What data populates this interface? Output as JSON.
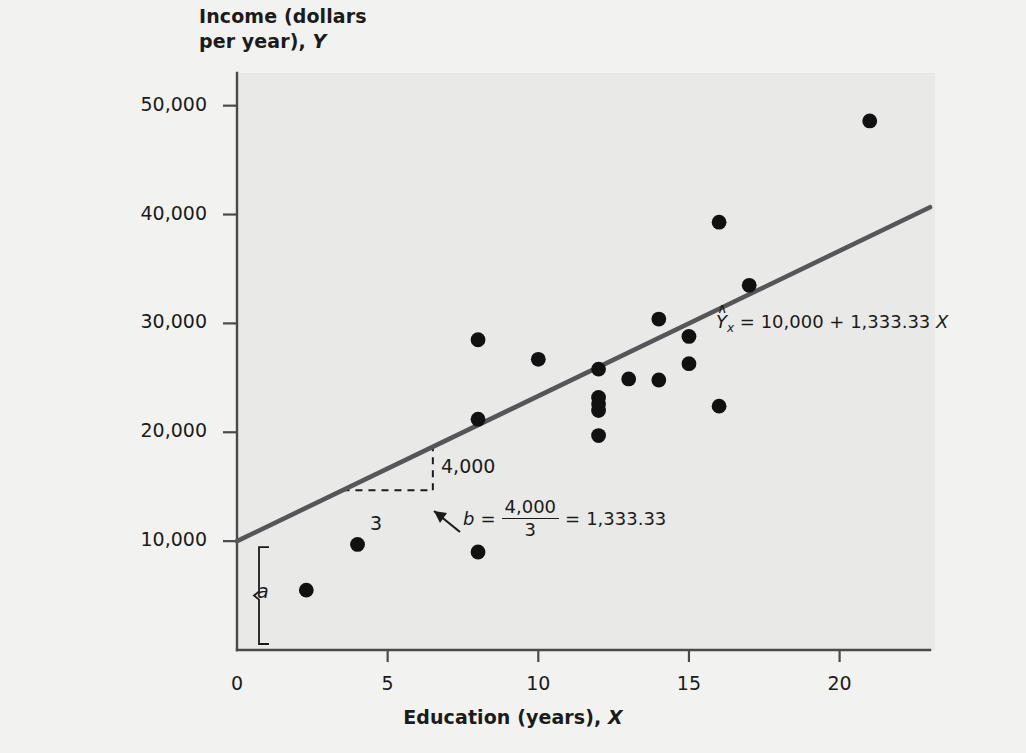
{
  "axes": {
    "y_title_line1": "Income (dollars",
    "y_title_line2": "per year), ",
    "y_title_var": "Y",
    "x_title": "Education (years), ",
    "x_title_var": "X",
    "y_ticks": [
      "50,000",
      "40,000",
      "30,000",
      "20,000",
      "10,000"
    ],
    "x_ticks": [
      "0",
      "5",
      "10",
      "15",
      "20"
    ]
  },
  "annotations": {
    "equation_var": "Y",
    "equation_hat": "∧",
    "equation_sub": "x",
    "equation_rest": " = 10,000 + 1,333.33 ",
    "equation_xvar": "X",
    "rise_label": "4,000",
    "run_label": "3",
    "intercept_label": "a",
    "slope_symbol": "b",
    "slope_equals": "=",
    "slope_numerator": "4,000",
    "slope_denominator": "3",
    "slope_equals2": "=",
    "slope_value": "1,333.33"
  },
  "colors": {
    "page_background": "#f2f2f0",
    "plot_background": "#e9e9e7",
    "axis": "#4a4a4a",
    "regression_line": "#55555a",
    "point": "#111111",
    "text": "#1b1b1b"
  },
  "chart_data": {
    "type": "scatter",
    "title": "",
    "xlabel": "Education (years), X",
    "ylabel": "Income (dollars per year), Y",
    "xlim": [
      0,
      23
    ],
    "ylim": [
      0,
      53000
    ],
    "grid": false,
    "legend": null,
    "points": [
      {
        "x": 2.3,
        "y": 5500
      },
      {
        "x": 4.0,
        "y": 9700
      },
      {
        "x": 8.0,
        "y": 9000
      },
      {
        "x": 8.0,
        "y": 21200
      },
      {
        "x": 8.0,
        "y": 28500
      },
      {
        "x": 10.0,
        "y": 26700
      },
      {
        "x": 12.0,
        "y": 19700
      },
      {
        "x": 12.0,
        "y": 22000
      },
      {
        "x": 12.0,
        "y": 22600
      },
      {
        "x": 12.0,
        "y": 23200
      },
      {
        "x": 12.0,
        "y": 25800
      },
      {
        "x": 13.0,
        "y": 24900
      },
      {
        "x": 14.0,
        "y": 24800
      },
      {
        "x": 14.0,
        "y": 30400
      },
      {
        "x": 15.0,
        "y": 26300
      },
      {
        "x": 15.0,
        "y": 28800
      },
      {
        "x": 16.0,
        "y": 22400
      },
      {
        "x": 16.0,
        "y": 39300
      },
      {
        "x": 17.0,
        "y": 33500
      },
      {
        "x": 21.0,
        "y": 48600
      }
    ],
    "fit_line": {
      "equation": "Ŷx = 10,000 + 1,333.33 X",
      "intercept": 10000,
      "slope": 1333.33,
      "x_start": 0,
      "x_end": 23
    },
    "slope_triangle": {
      "run": 3,
      "rise": 4000,
      "x_from": 3.5,
      "x_to": 6.5
    }
  }
}
